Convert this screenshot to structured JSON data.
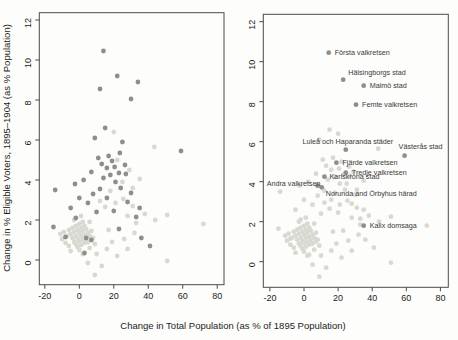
{
  "figure": {
    "width": 458,
    "height": 340,
    "background": "#fdfdfb",
    "x_axis_title": "Change in Total Population (as % of 1895 Population)",
    "y_axis_title": "Change in % Eligible Voters, 1895–1904 (as % Population)",
    "colors": {
      "dark_point": "#8e8e8a",
      "light_point": "#d9d9d2",
      "box_stroke": "#4a4a46",
      "tick_text": "#1c1c1c",
      "label_text": "#3a3a38"
    }
  },
  "chart_data": [
    {
      "type": "scatter",
      "panel": "left",
      "title": "",
      "xlabel": "Change in Total Population (as % of 1895 Population)",
      "ylabel": "Change in % Eligible Voters, 1895–1904 (as % Population)",
      "xlim": [
        -23,
        84
      ],
      "ylim": [
        -1.3,
        12.4
      ],
      "x_ticks": [
        -20,
        0,
        20,
        40,
        60,
        80
      ],
      "y_ticks": [
        0,
        2,
        4,
        6,
        8,
        10,
        12
      ],
      "grid": false,
      "legend": "none",
      "series": [
        {
          "name": "highlighted-constituencies",
          "color_key": "dark_point",
          "points": [
            [
              14,
              10.45
            ],
            [
              22,
              9.2
            ],
            [
              12,
              8.55
            ],
            [
              34,
              8.9
            ],
            [
              30,
              8.05
            ],
            [
              15,
              6.6
            ],
            [
              9,
              6.1
            ],
            [
              25,
              5.9
            ],
            [
              59,
              5.45
            ],
            [
              23.5,
              5.35
            ],
            [
              11,
              5.1
            ],
            [
              17,
              5.2
            ],
            [
              19,
              4.95
            ],
            [
              13,
              4.8
            ],
            [
              16,
              4.6
            ],
            [
              20.5,
              4.65
            ],
            [
              23,
              4.35
            ],
            [
              26.5,
              4.75
            ],
            [
              7,
              4.4
            ],
            [
              2.5,
              4
            ],
            [
              -2.5,
              3.8
            ],
            [
              -14,
              3.5
            ],
            [
              14,
              4.1
            ],
            [
              18,
              4.25
            ],
            [
              21,
              3.9
            ],
            [
              27,
              4.3
            ],
            [
              24,
              3.6
            ],
            [
              30,
              3.35
            ],
            [
              12,
              3.55
            ],
            [
              8,
              3.3
            ],
            [
              16,
              3.1
            ],
            [
              28,
              2.9
            ],
            [
              35,
              2.6
            ],
            [
              20,
              2.45
            ],
            [
              33,
              2.15
            ],
            [
              41,
              0.7
            ],
            [
              36,
              1.1
            ],
            [
              -2,
              2.1
            ],
            [
              -8,
              1.15
            ],
            [
              -15,
              1.65
            ],
            [
              4,
              1.1
            ],
            [
              7,
              1
            ],
            [
              3,
              0.35
            ],
            [
              23,
              1.55
            ],
            [
              10,
              2.4
            ],
            [
              5,
              2.85
            ],
            [
              0,
              3.1
            ],
            [
              -5,
              2.6
            ]
          ]
        },
        {
          "name": "other-constituencies",
          "color_key": "light_point",
          "points": [
            [
              20,
              6.4
            ],
            [
              43.5,
              5.65
            ],
            [
              22,
              5
            ],
            [
              29,
              4.5
            ],
            [
              35,
              4.05
            ],
            [
              25,
              3.9
            ],
            [
              31,
              3.6
            ],
            [
              18,
              3.45
            ],
            [
              25.5,
              3.05
            ],
            [
              31,
              2.7
            ],
            [
              38,
              2.3
            ],
            [
              44,
              2
            ],
            [
              28,
              2.2
            ],
            [
              33,
              1.85
            ],
            [
              21,
              2.85
            ],
            [
              15,
              2.65
            ],
            [
              12,
              2.95
            ],
            [
              -6,
              1.5
            ],
            [
              -5,
              1.3
            ],
            [
              -4,
              1.6
            ],
            [
              -4,
              1.1
            ],
            [
              -3,
              1.4
            ],
            [
              -3,
              0.9
            ],
            [
              -2,
              1.7
            ],
            [
              -2,
              1.2
            ],
            [
              -2,
              0.8
            ],
            [
              -1,
              1.5
            ],
            [
              -1,
              1.05
            ],
            [
              -1,
              0.65
            ],
            [
              0,
              1.8
            ],
            [
              0,
              1.35
            ],
            [
              0,
              0.95
            ],
            [
              1,
              1.6
            ],
            [
              1,
              1.2
            ],
            [
              1,
              0.75
            ],
            [
              2,
              1.9
            ],
            [
              2,
              1.45
            ],
            [
              2,
              1
            ],
            [
              3,
              1.7
            ],
            [
              3,
              1.25
            ],
            [
              3,
              0.85
            ],
            [
              4,
              1.55
            ],
            [
              4,
              1.05
            ],
            [
              5,
              1.35
            ],
            [
              5,
              0.9
            ],
            [
              6,
              1.2
            ],
            [
              7,
              1.45
            ],
            [
              8,
              1.1
            ],
            [
              -7,
              1.2
            ],
            [
              -8,
              0.85
            ],
            [
              -9,
              1.4
            ],
            [
              -6,
              0.7
            ],
            [
              -5,
              0.45
            ],
            [
              0,
              0.5
            ],
            [
              2,
              0.3
            ],
            [
              6,
              0.6
            ],
            [
              9,
              0.8
            ],
            [
              -10,
              1.05
            ],
            [
              -11,
              1.3
            ],
            [
              -3,
              2
            ],
            [
              1,
              2.2
            ],
            [
              6,
              1.9
            ],
            [
              9,
              -0.75
            ],
            [
              13,
              -0.3
            ],
            [
              5,
              -0.15
            ],
            [
              22,
              0.2
            ],
            [
              28,
              0.55
            ],
            [
              26,
              1.05
            ],
            [
              32,
              1.35
            ],
            [
              51,
              -0.05
            ],
            [
              72,
              1.8
            ],
            [
              51,
              2.25
            ],
            [
              10,
              0.3
            ],
            [
              16,
              0.55
            ],
            [
              19,
              0.9
            ],
            [
              17,
              1.5
            ]
          ]
        }
      ]
    },
    {
      "type": "scatter",
      "panel": "right",
      "title": "",
      "xlabel": "Change in Total Population (as % of 1895 Population)",
      "ylabel": "",
      "xlim": [
        -24,
        85
      ],
      "ylim": [
        -1.3,
        12.4
      ],
      "x_ticks": [
        -20,
        0,
        20,
        40,
        60,
        80
      ],
      "y_ticks": [
        0,
        2,
        4,
        6,
        8,
        10,
        12
      ],
      "grid": false,
      "legend": "none",
      "unlabeled_points": "same data as left panel, drawn in light_point color",
      "points_absent_here": [
        [
          12,
          8.55
        ]
      ],
      "labeled_points": [
        {
          "label": "Första valkretsen",
          "x": 14.5,
          "y": 10.45,
          "anchor": "start",
          "dx": 6,
          "dy": 2.5
        },
        {
          "label": "Hälsingborgs stad",
          "x": 23,
          "y": 9.1,
          "anchor": "start",
          "dx": 5,
          "dy": -5
        },
        {
          "label": "Malmö stad",
          "x": 35,
          "y": 8.8,
          "anchor": "start",
          "dx": 6,
          "dy": 2.5
        },
        {
          "label": "Femte valkretsen",
          "x": 30.5,
          "y": 7.85,
          "anchor": "start",
          "dx": 6,
          "dy": 2.5
        },
        {
          "label": "Luleå och Haparanda städer",
          "x": 24.5,
          "y": 5.6,
          "anchor": "middle",
          "dx": 2,
          "dy": -6
        },
        {
          "label": "Västerås stad",
          "x": 59,
          "y": 5.3,
          "anchor": "middle",
          "dx": 16,
          "dy": -7
        },
        {
          "label": "Fjärde valkretsen",
          "x": 19,
          "y": 4.95,
          "anchor": "start",
          "dx": 6,
          "dy": 2.5
        },
        {
          "label": "Tredje valkretsen",
          "x": 24.5,
          "y": 4.45,
          "anchor": "start",
          "dx": 6,
          "dy": 2.5
        },
        {
          "label": "Karlskrona stad",
          "x": 12,
          "y": 4.25,
          "anchor": "start",
          "dx": 5,
          "dy": 2.5
        },
        {
          "label": "Andra valkretsen",
          "x": 8,
          "y": 3.8,
          "anchor": "end",
          "dx": 3,
          "dy": 0
        },
        {
          "label": "Norunda and Örbyhus härad",
          "x": 10.4,
          "y": 3.72,
          "anchor": "start",
          "dx": 4,
          "dy": 9
        },
        {
          "label": "Kalix domsaga",
          "x": 35,
          "y": 1.8,
          "anchor": "start",
          "dx": 6,
          "dy": 2.5
        }
      ]
    }
  ]
}
